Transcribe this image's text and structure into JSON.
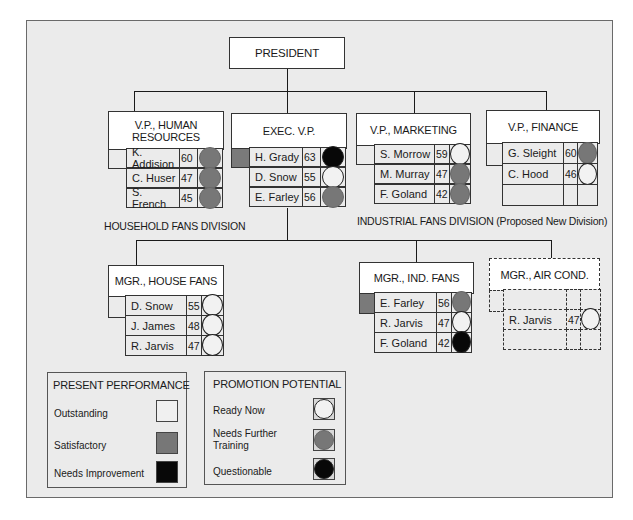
{
  "chart_title": "Organization chart with personnel replacement ratings",
  "president": {
    "label": "PRESIDENT"
  },
  "colors": {
    "background": "#ebebeb",
    "outstanding": "#f0f0f0",
    "satisfactory": "#777777",
    "needs_improvement": "#080808",
    "ready_now": "#f2f2f2",
    "needs_further_training": "#777777",
    "questionable": "#080808"
  },
  "vps": [
    {
      "title": "V.P., HUMAN RESOURCES",
      "incumbent_performance": "outstanding",
      "candidates": [
        {
          "name": "K. Addision",
          "age": "60",
          "potential": "needs_further_training"
        },
        {
          "name": "C. Huser",
          "age": "47",
          "potential": "needs_further_training"
        },
        {
          "name": "S. French",
          "age": "45",
          "potential": "needs_further_training"
        }
      ]
    },
    {
      "title": "EXEC. V.P.",
      "incumbent_performance": "satisfactory",
      "candidates": [
        {
          "name": "H. Grady",
          "age": "63",
          "potential": "questionable"
        },
        {
          "name": "D. Snow",
          "age": "55",
          "potential": "ready_now"
        },
        {
          "name": "E. Farley",
          "age": "56",
          "potential": "needs_further_training"
        }
      ]
    },
    {
      "title": "V.P., MARKETING",
      "incumbent_performance": "outstanding",
      "candidates": [
        {
          "name": "S. Morrow",
          "age": "59",
          "potential": "ready_now"
        },
        {
          "name": "M. Murray",
          "age": "47",
          "potential": "needs_further_training"
        },
        {
          "name": "F. Goland",
          "age": "42",
          "potential": "needs_further_training"
        }
      ]
    },
    {
      "title": "V.P., FINANCE",
      "incumbent_performance": "outstanding",
      "candidates": [
        {
          "name": "G. Sleight",
          "age": "60",
          "potential": "needs_further_training"
        },
        {
          "name": "C. Hood",
          "age": "46",
          "potential": "ready_now"
        },
        {
          "name": "",
          "age": "",
          "potential": ""
        }
      ]
    }
  ],
  "divisions": {
    "household": "HOUSEHOLD FANS DIVISION",
    "industrial": "INDUSTRIAL FANS DIVISION (Proposed New Division)"
  },
  "managers": [
    {
      "title": "MGR., HOUSE FANS",
      "incumbent_performance": "outstanding",
      "candidates": [
        {
          "name": "D. Snow",
          "age": "55",
          "potential": "ready_now"
        },
        {
          "name": "J. James",
          "age": "48",
          "potential": "ready_now"
        },
        {
          "name": "R. Jarvis",
          "age": "47",
          "potential": "ready_now"
        }
      ]
    },
    {
      "title": "MGR., IND. FANS",
      "incumbent_performance": "satisfactory",
      "candidates": [
        {
          "name": "E. Farley",
          "age": "56",
          "potential": "needs_further_training"
        },
        {
          "name": "R. Jarvis",
          "age": "47",
          "potential": "ready_now"
        },
        {
          "name": "F. Goland",
          "age": "42",
          "potential": "questionable"
        }
      ]
    },
    {
      "title": "MGR., AIR COND.",
      "proposed": true,
      "incumbent_performance": "",
      "candidates": [
        {
          "name": "",
          "age": "",
          "potential": ""
        },
        {
          "name": "R. Jarvis",
          "age": "47",
          "potential": "ready_now"
        },
        {
          "name": "",
          "age": "",
          "potential": ""
        }
      ]
    }
  ],
  "legend": {
    "performance": {
      "title": "PRESENT PERFORMANCE",
      "items": [
        {
          "label": "Outstanding",
          "key": "outstanding"
        },
        {
          "label": "Satisfactory",
          "key": "satisfactory"
        },
        {
          "label": "Needs Improvement",
          "key": "needs_improvement"
        }
      ]
    },
    "potential": {
      "title": "PROMOTION POTENTIAL",
      "items": [
        {
          "label": "Ready Now",
          "key": "ready_now"
        },
        {
          "label": "Needs Further Training",
          "key": "needs_further_training"
        },
        {
          "label": "Questionable",
          "key": "questionable"
        }
      ]
    }
  }
}
